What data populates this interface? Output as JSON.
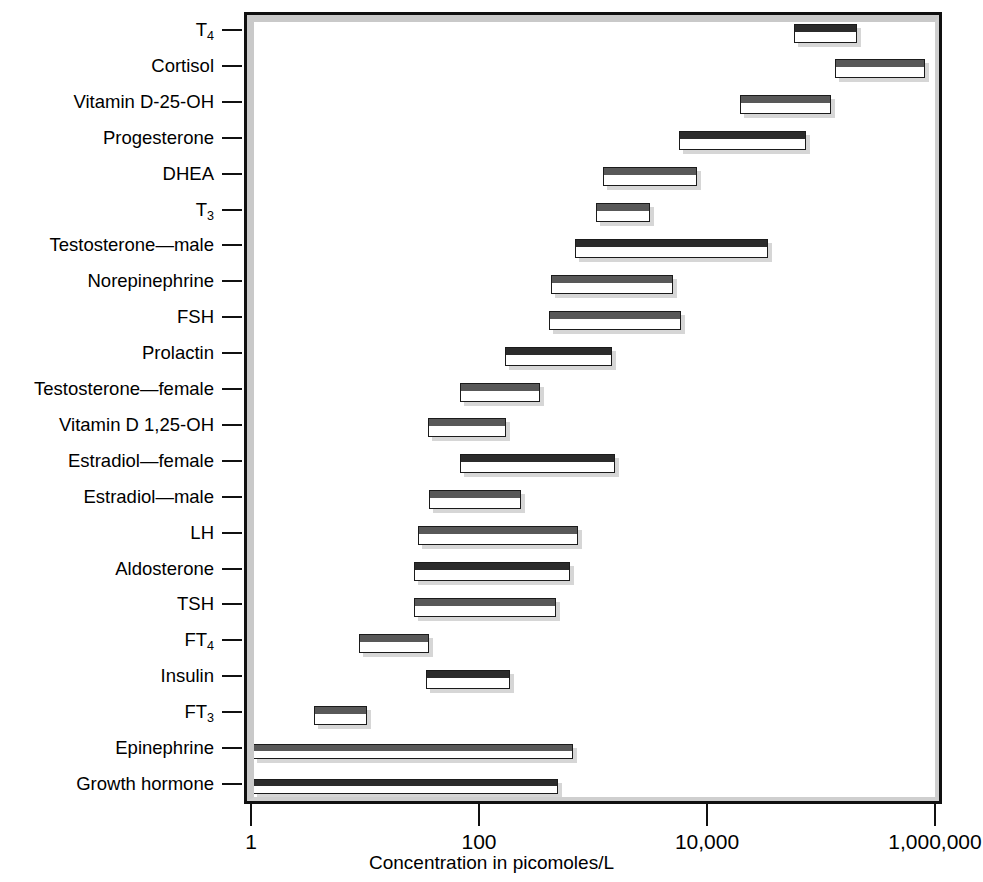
{
  "chart_data": {
    "type": "bar",
    "subtype": "range-bars-horizontal",
    "title": "",
    "xlabel": "Concentration in picomoles/L",
    "ylabel": "",
    "xscale": "log",
    "xlim": [
      1,
      1000000
    ],
    "xticks": [
      1,
      100,
      10000,
      1000000
    ],
    "xticklabels": [
      "1",
      "100",
      "10,000",
      "1,000,000"
    ],
    "grid": false,
    "legend": null,
    "categories": [
      "T₄",
      "Cortisol",
      "Vitamin D-25-OH",
      "Progesterone",
      "DHEA",
      "T₃",
      "Testosterone—male",
      "Norepinephrine",
      "FSH",
      "Prolactin",
      "Testosterone—female",
      "Vitamin D 1,25-OH",
      "Estradiol—female",
      "Estradiol—male",
      "LH",
      "Aldosterone",
      "TSH",
      "FT₄",
      "Insulin",
      "FT₃",
      "Epinephrine",
      "Growth hormone"
    ],
    "ranges": [
      {
        "label": "T4",
        "low": 56000,
        "high": 200000
      },
      {
        "label": "Cortisol",
        "low": 128000,
        "high": 780000
      },
      {
        "label": "Vitamin D-25-OH",
        "low": 18700,
        "high": 117000
      },
      {
        "label": "Progesterone",
        "low": 5500,
        "high": 71000
      },
      {
        "label": "DHEA",
        "low": 1180,
        "high": 7800
      },
      {
        "label": "T3",
        "low": 1020,
        "high": 3050
      },
      {
        "label": "Testosterone-male",
        "low": 670,
        "high": 32800
      },
      {
        "label": "Norepinephrine",
        "low": 410,
        "high": 4800
      },
      {
        "label": "FSH",
        "low": 395,
        "high": 5700
      },
      {
        "label": "Prolactin",
        "low": 163,
        "high": 1410
      },
      {
        "label": "Testosterone-female",
        "low": 66,
        "high": 330
      },
      {
        "label": "Vitamin D 1,25-OH",
        "low": 34,
        "high": 166
      },
      {
        "label": "Estradiol-female",
        "low": 66,
        "high": 1500
      },
      {
        "label": "Estradiol-male",
        "low": 35,
        "high": 225
      },
      {
        "label": "LH",
        "low": 28,
        "high": 710
      },
      {
        "label": "Aldosterone",
        "low": 26,
        "high": 600
      },
      {
        "label": "TSH",
        "low": 26,
        "high": 455
      },
      {
        "label": "FT4",
        "low": 8.5,
        "high": 35
      },
      {
        "label": "Insulin",
        "low": 33,
        "high": 180
      },
      {
        "label": "FT3",
        "low": 3.4,
        "high": 10
      },
      {
        "label": "Epinephrine",
        "low": 1,
        "high": 640
      },
      {
        "label": "Growth hormone",
        "low": 1,
        "high": 475
      }
    ]
  },
  "axis": {
    "x_title": "Concentration in picomoles/L",
    "tick_labels": [
      "1",
      "100",
      "10,000",
      "1,000,000"
    ]
  },
  "y_labels": [
    {
      "text": "T",
      "sub": "4"
    },
    {
      "text": "Cortisol",
      "sub": ""
    },
    {
      "text": "Vitamin D-25-OH",
      "sub": ""
    },
    {
      "text": "Progesterone",
      "sub": ""
    },
    {
      "text": "DHEA",
      "sub": ""
    },
    {
      "text": "T",
      "sub": "3"
    },
    {
      "text": "Testosterone—male",
      "sub": ""
    },
    {
      "text": "Norepinephrine",
      "sub": ""
    },
    {
      "text": "FSH",
      "sub": ""
    },
    {
      "text": "Prolactin",
      "sub": ""
    },
    {
      "text": "Testosterone—female",
      "sub": ""
    },
    {
      "text": "Vitamin D 1,25-OH",
      "sub": ""
    },
    {
      "text": "Estradiol—female",
      "sub": ""
    },
    {
      "text": "Estradiol—male",
      "sub": ""
    },
    {
      "text": "LH",
      "sub": ""
    },
    {
      "text": "Aldosterone",
      "sub": ""
    },
    {
      "text": "TSH",
      "sub": ""
    },
    {
      "text": "FT",
      "sub": "4"
    },
    {
      "text": "Insulin",
      "sub": ""
    },
    {
      "text": "FT",
      "sub": "3"
    },
    {
      "text": "Epinephrine",
      "sub": ""
    },
    {
      "text": "Growth hormone",
      "sub": ""
    }
  ],
  "style": {
    "bar_fill": "#ffffff",
    "bar_border": "#1b1b1b",
    "bar_top_dark": "#2b2b2b",
    "bar_top_mid": "#585858",
    "bar_top_light": "#8d8d8d",
    "frame_color": "#101010",
    "bevel_color": "#c9c9c9",
    "text_color": "#000000",
    "background": "#ffffff"
  },
  "bar_shades": [
    "dark",
    "mid",
    "mid",
    "dark",
    "mid",
    "mid",
    "dark",
    "mid",
    "mid",
    "dark",
    "mid",
    "mid",
    "dark",
    "mid",
    "mid",
    "dark",
    "mid",
    "mid",
    "dark",
    "mid",
    "mid",
    "dark"
  ]
}
